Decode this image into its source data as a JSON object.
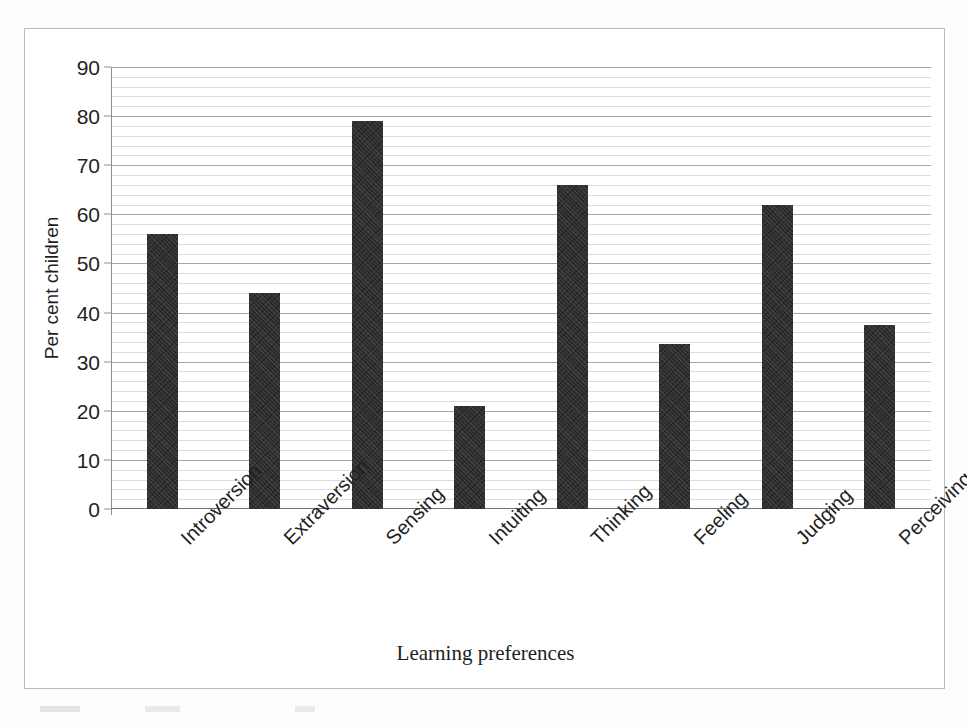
{
  "chart_data": {
    "type": "bar",
    "title": "",
    "xlabel": "Learning preferences",
    "ylabel": "Per cent children",
    "categories": [
      "Introversion",
      "Extraversion",
      "Sensing",
      "Intuiting",
      "Thinking",
      "Feeling",
      "Judging",
      "Perceiving"
    ],
    "values": [
      56,
      44,
      79,
      21,
      66,
      33.5,
      62,
      37.5
    ],
    "ylim": [
      0,
      90
    ],
    "ytick_labels": [
      "0",
      "10",
      "20",
      "30",
      "40",
      "50",
      "60",
      "70",
      "80",
      "90"
    ],
    "ytick_values": [
      0,
      10,
      20,
      30,
      40,
      50,
      60,
      70,
      80,
      90
    ],
    "y_major_step": 10,
    "y_minor_step": 2,
    "grid": "horizontal-major-and-minor",
    "legend": "none",
    "bar_color": "#302f2f",
    "gridline_color": "#787c80",
    "axis_color": "#8c9094",
    "background_color": "#ffffff",
    "xtick_label_rotation": -45
  },
  "figure": {
    "frame_border_color": "#b9bcbe"
  }
}
